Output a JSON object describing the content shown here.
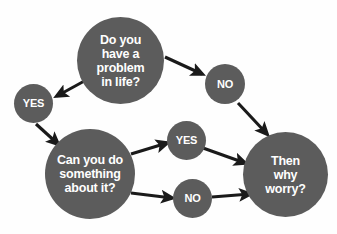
{
  "diagram": {
    "background_color": "#fefefe",
    "node_fill_color": "#5c5c5c",
    "node_text_color": "#ffffff",
    "arrow_color": "#1a1a1a",
    "nodes": [
      {
        "id": "problem",
        "label": "Do you\nhave a\nproblem\nin life?",
        "shape": "circle",
        "type": "question"
      },
      {
        "id": "yes_1",
        "label": "YES",
        "shape": "circle",
        "type": "answer"
      },
      {
        "id": "no_1",
        "label": "NO",
        "shape": "circle",
        "type": "answer"
      },
      {
        "id": "cando",
        "label": "Can you do\nsomething\nabout it?",
        "shape": "circle",
        "type": "question"
      },
      {
        "id": "yes_2",
        "label": "YES",
        "shape": "circle",
        "type": "answer"
      },
      {
        "id": "no_2",
        "label": "NO",
        "shape": "circle",
        "type": "answer"
      },
      {
        "id": "worry",
        "label": "Then\nwhy\nworry?",
        "shape": "circle",
        "type": "conclusion"
      }
    ],
    "edges": [
      {
        "id": "problem-to-yes1",
        "from": "problem",
        "to": "yes_1",
        "label": ""
      },
      {
        "id": "problem-to-no1",
        "from": "problem",
        "to": "no_1",
        "label": ""
      },
      {
        "id": "yes1-to-cando",
        "from": "yes_1",
        "to": "cando",
        "label": ""
      },
      {
        "id": "no1-to-worry",
        "from": "no_1",
        "to": "worry",
        "label": ""
      },
      {
        "id": "cando-to-yes2",
        "from": "cando",
        "to": "yes_2",
        "label": ""
      },
      {
        "id": "cando-to-no2",
        "from": "cando",
        "to": "no_2",
        "label": ""
      },
      {
        "id": "yes2-to-worry",
        "from": "yes_2",
        "to": "worry",
        "label": ""
      },
      {
        "id": "no2-to-worry",
        "from": "no_2",
        "to": "worry",
        "label": ""
      }
    ]
  }
}
